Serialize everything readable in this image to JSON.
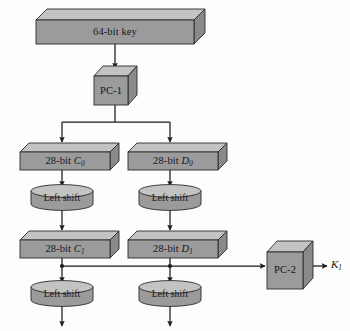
{
  "diagram": {
    "background_color": "#fdfdfd",
    "shape_front_color": "#9b9b9b",
    "shape_top_color": "#c3c3c3",
    "shape_side_color": "#8a8a8a",
    "line_color": "#1b1b1f",
    "nodes": {
      "key": {
        "label": "64-bit key",
        "shape": "slab"
      },
      "pc1": {
        "label": "PC-1",
        "shape": "cube"
      },
      "c0": {
        "label_prefix": "28-bit ",
        "var": "C",
        "subscript": "0",
        "shape": "slab"
      },
      "d0": {
        "label_prefix": "28-bit ",
        "var": "D",
        "subscript": "0",
        "shape": "slab"
      },
      "shift_c0": {
        "label": "Left shift",
        "shape": "cylinder"
      },
      "shift_d0": {
        "label": "Left shift",
        "shape": "cylinder"
      },
      "c1": {
        "label_prefix": "28-bit ",
        "var": "C",
        "subscript": "1",
        "shape": "slab"
      },
      "d1": {
        "label_prefix": "28-bit ",
        "var": "D",
        "subscript": "1",
        "shape": "slab"
      },
      "shift_c1": {
        "label": "Left shift",
        "shape": "cylinder"
      },
      "shift_d1": {
        "label": "Left shift",
        "shape": "cylinder"
      },
      "pc2": {
        "label": "PC-2",
        "shape": "cube"
      },
      "output_key": {
        "var": "K",
        "subscript": "1"
      }
    }
  }
}
